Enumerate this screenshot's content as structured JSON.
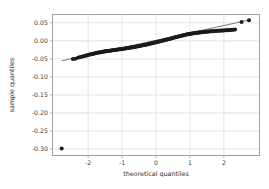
{
  "chart_data": {
    "type": "scatter",
    "title": "",
    "xlabel": "theoretical quantiles",
    "ylabel": "sample quantiles",
    "xlim": [
      -3.05,
      3.05
    ],
    "ylim": [
      -0.318,
      0.073
    ],
    "xticks": [
      -2,
      -1,
      0,
      1,
      2
    ],
    "xticklabels": [
      "-2",
      "-1",
      "0",
      "1",
      "2"
    ],
    "yticks": [
      0.05,
      0.0,
      -0.05,
      -0.1,
      -0.15,
      -0.2,
      -0.25,
      -0.3
    ],
    "yticklabels": [
      "0.05",
      "0.00",
      "-0.05",
      "-0.10",
      "-0.15",
      "-0.20",
      "-0.25",
      "-0.30"
    ],
    "grid": true,
    "legend": "none",
    "marker": "filled-circle",
    "marker_color": "#1b1b1b",
    "marker_size": 2.0,
    "line_color": "#4d4d4d",
    "grid_color": "#d8d8d8",
    "frame_color": "#9a9a9a",
    "background": "#ffffff",
    "reference_line": {
      "label": "45-degree fit line",
      "x": [
        -2.78,
        2.78
      ],
      "y": [
        -0.0555,
        0.0585
      ]
    },
    "series": [
      {
        "name": "sample quantiles",
        "points": [
          [
            -2.78,
            -0.2985
          ],
          [
            -2.45,
            -0.0505
          ],
          [
            -2.38,
            -0.0497
          ],
          [
            -2.3,
            -0.0468
          ],
          [
            -2.24,
            -0.0452
          ],
          [
            -2.19,
            -0.0441
          ],
          [
            -2.14,
            -0.0428
          ],
          [
            -2.1,
            -0.0418
          ],
          [
            -2.06,
            -0.0406
          ],
          [
            -2.02,
            -0.0398
          ],
          [
            -1.98,
            -0.0389
          ],
          [
            -1.95,
            -0.0382
          ],
          [
            -1.91,
            -0.0374
          ],
          [
            -1.88,
            -0.0367
          ],
          [
            -1.85,
            -0.0359
          ],
          [
            -1.82,
            -0.0352
          ],
          [
            -1.79,
            -0.0345
          ],
          [
            -1.76,
            -0.0339
          ],
          [
            -1.73,
            -0.0333
          ],
          [
            -1.7,
            -0.0327
          ],
          [
            -1.67,
            -0.0322
          ],
          [
            -1.64,
            -0.0316
          ],
          [
            -1.61,
            -0.0311
          ],
          [
            -1.58,
            -0.0306
          ],
          [
            -1.55,
            -0.0301
          ],
          [
            -1.52,
            -0.0296
          ],
          [
            -1.5,
            -0.0292
          ],
          [
            -1.47,
            -0.0288
          ],
          [
            -1.44,
            -0.0284
          ],
          [
            -1.41,
            -0.028
          ],
          [
            -1.38,
            -0.0276
          ],
          [
            -1.35,
            -0.0272
          ],
          [
            -1.32,
            -0.0268
          ],
          [
            -1.29,
            -0.0264
          ],
          [
            -1.26,
            -0.026
          ],
          [
            -1.23,
            -0.0256
          ],
          [
            -1.2,
            -0.0252
          ],
          [
            -1.17,
            -0.0248
          ],
          [
            -1.14,
            -0.0244
          ],
          [
            -1.11,
            -0.024
          ],
          [
            -1.08,
            -0.0236
          ],
          [
            -1.05,
            -0.0232
          ],
          [
            -1.02,
            -0.0228
          ],
          [
            -0.99,
            -0.0224
          ],
          [
            -0.96,
            -0.022
          ],
          [
            -0.93,
            -0.0216
          ],
          [
            -0.9,
            -0.0211
          ],
          [
            -0.87,
            -0.0207
          ],
          [
            -0.84,
            -0.0202
          ],
          [
            -0.81,
            -0.0198
          ],
          [
            -0.78,
            -0.0193
          ],
          [
            -0.75,
            -0.0188
          ],
          [
            -0.72,
            -0.0183
          ],
          [
            -0.69,
            -0.0178
          ],
          [
            -0.66,
            -0.0173
          ],
          [
            -0.63,
            -0.0168
          ],
          [
            -0.6,
            -0.0163
          ],
          [
            -0.57,
            -0.0158
          ],
          [
            -0.54,
            -0.0152
          ],
          [
            -0.51,
            -0.0147
          ],
          [
            -0.48,
            -0.0141
          ],
          [
            -0.45,
            -0.0136
          ],
          [
            -0.42,
            -0.013
          ],
          [
            -0.39,
            -0.0124
          ],
          [
            -0.36,
            -0.0118
          ],
          [
            -0.33,
            -0.0112
          ],
          [
            -0.3,
            -0.0106
          ],
          [
            -0.27,
            -0.01
          ],
          [
            -0.24,
            -0.0094
          ],
          [
            -0.21,
            -0.0088
          ],
          [
            -0.18,
            -0.0082
          ],
          [
            -0.15,
            -0.0075
          ],
          [
            -0.12,
            -0.0069
          ],
          [
            -0.09,
            -0.0062
          ],
          [
            -0.06,
            -0.0056
          ],
          [
            -0.03,
            -0.0049
          ],
          [
            0.0,
            -0.0042
          ],
          [
            0.03,
            -0.0035
          ],
          [
            0.06,
            -0.0028
          ],
          [
            0.09,
            -0.0021
          ],
          [
            0.12,
            -0.0014
          ],
          [
            0.15,
            -0.0007
          ],
          [
            0.18,
            0.0
          ],
          [
            0.21,
            0.0007
          ],
          [
            0.24,
            0.0014
          ],
          [
            0.27,
            0.0022
          ],
          [
            0.3,
            0.0029
          ],
          [
            0.33,
            0.0037
          ],
          [
            0.36,
            0.0044
          ],
          [
            0.39,
            0.0052
          ],
          [
            0.42,
            0.006
          ],
          [
            0.45,
            0.0067
          ],
          [
            0.48,
            0.0075
          ],
          [
            0.51,
            0.0083
          ],
          [
            0.54,
            0.0091
          ],
          [
            0.57,
            0.0098
          ],
          [
            0.6,
            0.0106
          ],
          [
            0.63,
            0.0113
          ],
          [
            0.66,
            0.0121
          ],
          [
            0.69,
            0.0128
          ],
          [
            0.72,
            0.0135
          ],
          [
            0.75,
            0.0142
          ],
          [
            0.78,
            0.0149
          ],
          [
            0.81,
            0.0156
          ],
          [
            0.84,
            0.0162
          ],
          [
            0.87,
            0.0168
          ],
          [
            0.9,
            0.0174
          ],
          [
            0.93,
            0.018
          ],
          [
            0.96,
            0.0186
          ],
          [
            0.99,
            0.0191
          ],
          [
            1.02,
            0.0196
          ],
          [
            1.05,
            0.0201
          ],
          [
            1.08,
            0.0206
          ],
          [
            1.11,
            0.0211
          ],
          [
            1.14,
            0.0215
          ],
          [
            1.17,
            0.0219
          ],
          [
            1.2,
            0.0223
          ],
          [
            1.23,
            0.0227
          ],
          [
            1.26,
            0.0231
          ],
          [
            1.29,
            0.0234
          ],
          [
            1.32,
            0.0238
          ],
          [
            1.35,
            0.0241
          ],
          [
            1.38,
            0.0244
          ],
          [
            1.41,
            0.0247
          ],
          [
            1.44,
            0.025
          ],
          [
            1.47,
            0.0253
          ],
          [
            1.5,
            0.0255
          ],
          [
            1.53,
            0.0258
          ],
          [
            1.56,
            0.026
          ],
          [
            1.6,
            0.0263
          ],
          [
            1.64,
            0.0266
          ],
          [
            1.68,
            0.0268
          ],
          [
            1.72,
            0.0271
          ],
          [
            1.76,
            0.0273
          ],
          [
            1.8,
            0.0276
          ],
          [
            1.84,
            0.0278
          ],
          [
            1.88,
            0.0281
          ],
          [
            1.92,
            0.0283
          ],
          [
            1.96,
            0.0286
          ],
          [
            2.0,
            0.0288
          ],
          [
            2.04,
            0.0291
          ],
          [
            2.08,
            0.0293
          ],
          [
            2.12,
            0.0296
          ],
          [
            2.16,
            0.0299
          ],
          [
            2.2,
            0.0302
          ],
          [
            2.24,
            0.0305
          ],
          [
            2.28,
            0.0308
          ],
          [
            2.33,
            0.0311
          ],
          [
            2.52,
            0.0525
          ],
          [
            2.74,
            0.0572
          ]
        ]
      }
    ]
  }
}
